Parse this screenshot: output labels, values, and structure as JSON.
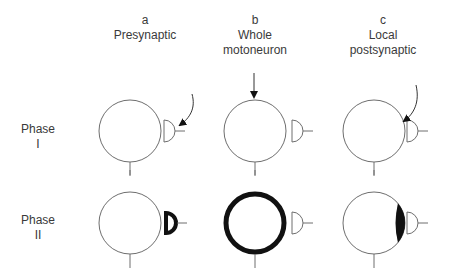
{
  "columns": [
    {
      "letter": "a",
      "title_line1": "Presynaptic",
      "title_line2": ""
    },
    {
      "letter": "b",
      "title_line1": "Whole",
      "title_line2": "motoneuron"
    },
    {
      "letter": "c",
      "title_line1": "Local",
      "title_line2": "postsynaptic"
    }
  ],
  "rows": [
    {
      "label_line1": "Phase",
      "label_line2": "I"
    },
    {
      "label_line1": "Phase",
      "label_line2": "II"
    }
  ],
  "colors": {
    "line": "#6e6e6e",
    "highlight": "#111111",
    "text": "#3a3a3a"
  }
}
